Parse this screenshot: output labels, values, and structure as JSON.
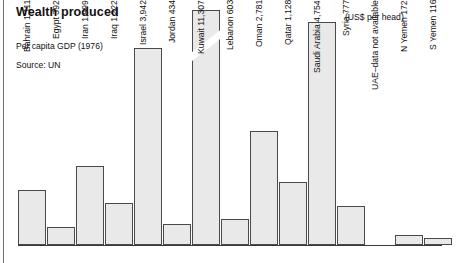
{
  "header": {
    "title": "Wealth produced",
    "subtitle": "Per capita GDP (1976)",
    "source": "Source: UN",
    "units": "(US$ per head)"
  },
  "notes": {
    "uae": "UAE–data not available"
  },
  "chart_data": {
    "type": "bar",
    "title": "Wealth produced",
    "subtitle": "Per capita GDP (1976)",
    "source": "Source: UN",
    "xlabel": "",
    "ylabel": "(US$ per head)",
    "ylim": [
      0,
      11307
    ],
    "grid": false,
    "legend": null,
    "axis_break": "Kuwait bar is drawn with a scale break (diagonal slash)",
    "categories": [
      "Bahrain",
      "Egypt",
      "Iran",
      "Iraq",
      "Israel",
      "Jordan",
      "Kuwait",
      "Lebanon",
      "Oman",
      "Qatar",
      "Saudi Arabia",
      "Syria",
      "UAE",
      "N Yemen",
      "S Yemen"
    ],
    "values": [
      1111,
      392,
      1999,
      1222,
      3942,
      434,
      11307,
      603,
      2781,
      1128,
      4754,
      777,
      null,
      172,
      116
    ],
    "bars": [
      {
        "label": "Bahrain 1,111",
        "name": "Bahrain",
        "value": 1111,
        "value_text": "1,111"
      },
      {
        "label": "Egypt 392",
        "name": "Egypt",
        "value": 392,
        "value_text": "392"
      },
      {
        "label": "Iran 1,999",
        "name": "Iran",
        "value": 1999,
        "value_text": "1,999"
      },
      {
        "label": "Iraq 1,222",
        "name": "Iraq",
        "value": 1222,
        "value_text": "1,222"
      },
      {
        "label": "Israel 3,942",
        "name": "Israel",
        "value": 3942,
        "value_text": "3,942"
      },
      {
        "label": "Jordan 434",
        "name": "Jordan",
        "value": 434,
        "value_text": "434"
      },
      {
        "label": "Kuwait 11,307",
        "name": "Kuwait",
        "value": 11307,
        "value_text": "11,307"
      },
      {
        "label": "Lebanon 603",
        "name": "Lebanon",
        "value": 603,
        "value_text": "603"
      },
      {
        "label": "Oman 2,781",
        "name": "Oman",
        "value": 2781,
        "value_text": "2,781"
      },
      {
        "label": "Qatar 1,128",
        "name": "Qatar",
        "value": 1128,
        "value_text": "1,128"
      },
      {
        "label": "Saudi Arabia 4,754",
        "name": "Saudi Arabia",
        "value": 4754,
        "value_text": "4,754"
      },
      {
        "label": "Syria 777",
        "name": "Syria",
        "value": 777,
        "value_text": "777"
      },
      {
        "label": "UAE–data not available",
        "name": "UAE",
        "value": null,
        "value_text": "data not available"
      },
      {
        "label": "N Yemen 172",
        "name": "N Yemen",
        "value": 172,
        "value_text": "172"
      },
      {
        "label": "S Yemen 116",
        "name": "S Yemen",
        "value": 116,
        "value_text": "116"
      }
    ]
  },
  "geometry": {
    "comment": "pixel geometry used for rendering only",
    "baseline_y": 245,
    "bar_width": 28,
    "slots_x": [
      0,
      29,
      58,
      87,
      116,
      145,
      174,
      203,
      232,
      261,
      290,
      319,
      348,
      377,
      406
    ],
    "tops_y": [
      190,
      227,
      166,
      203,
      48,
      224,
      10,
      219,
      131,
      182,
      22,
      206,
      null,
      235,
      238
    ]
  },
  "colors": {
    "bar_fill": "#e9e9e9",
    "bar_stroke": "#4a4a4a",
    "text": "#111111",
    "background": "#ffffff",
    "rule": "#6e6e6e"
  }
}
